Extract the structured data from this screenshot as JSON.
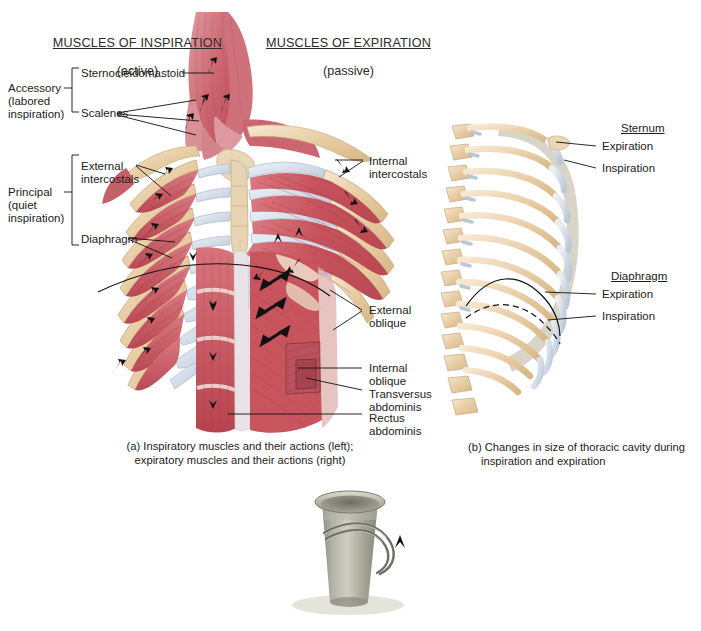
{
  "figure": {
    "headers": [
      {
        "title": "MUSCLES OF INSPIRATION",
        "subtitle": "(active)"
      },
      {
        "title": "MUSCLES OF EXPIRATION",
        "subtitle": "(passive)"
      }
    ],
    "panel_a": {
      "caption_line1": "(a) Inspiratory muscles and their actions (left);",
      "caption_line2": "expiratory muscles and their actions (right)",
      "bracket_groups": [
        {
          "name": "Accessory",
          "lines": [
            "Accessory",
            "(labored",
            "inspiration)"
          ],
          "members": [
            "Sternocleidomastoid",
            "Scalenes"
          ]
        },
        {
          "name": "Principal",
          "lines": [
            "Principal",
            "(quiet",
            "inspiration)"
          ],
          "members": [
            "External",
            "intercostals",
            "Diaphragm"
          ]
        }
      ],
      "left_labels": {
        "accessory_l1": "Accessory",
        "accessory_l2": "(labored",
        "accessory_l3": "inspiration)",
        "sternocleidomastoid": "Sternocleidomastoid",
        "scalenes": "Scalenes",
        "principal_l1": "Principal",
        "principal_l2": "(quiet",
        "principal_l3": "inspiration)",
        "external_intercostals_l1": "External",
        "external_intercostals_l2": "intercostals",
        "diaphragm": "Diaphragm"
      },
      "right_labels": {
        "internal_intercostals_l1": "Internal",
        "internal_intercostals_l2": "intercostals",
        "external_oblique_l1": "External",
        "external_oblique_l2": "oblique",
        "internal_oblique_l1": "Internal",
        "internal_oblique_l2": "oblique",
        "transversus_abdominis_l1": "Transversus",
        "transversus_abdominis_l2": "abdominis",
        "rectus_abdominis_l1": "Rectus",
        "rectus_abdominis_l2": "abdominis"
      }
    },
    "panel_b": {
      "caption_line1": "(b) Changes in size of thoracic cavity during",
      "caption_line2": "inspiration and expiration",
      "groups": [
        {
          "heading": "Sternum",
          "items": [
            "Expiration",
            "Inspiration"
          ]
        },
        {
          "heading": "Diaphragm",
          "items": [
            "Expiration",
            "Inspiration"
          ]
        }
      ],
      "sternum_heading": "Sternum",
      "sternum_expiration": "Expiration",
      "sternum_inspiration": "Inspiration",
      "diaphragm_heading": "Diaphragm",
      "diaphragm_expiration": "Expiration",
      "diaphragm_inspiration": "Inspiration"
    },
    "panel_c": {
      "icon": "bucket-handle-icon",
      "arrow": "up-arrow-icon"
    },
    "colors": {
      "muscle_red": "#c9515a",
      "muscle_light": "#d98a8c",
      "bone_tan": "#e8cfa8",
      "cartilage_blue": "#ccd8e4",
      "sternum": "#e3d1b0",
      "shadow_gray": "#cfcabd",
      "bucket_gray": "#9b9a8e",
      "arrow_black": "#111111",
      "text": "#1c1c1c"
    }
  }
}
